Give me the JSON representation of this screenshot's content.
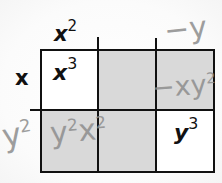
{
  "diagram": {
    "type": "polynomial-multiplication-box",
    "colors": {
      "grid_line": "#111111",
      "shaded_cell": "#d9d9d9",
      "white_cell": "#ffffff",
      "pencil": "#8d8d8d",
      "ink": "#111111"
    },
    "column_headers": [
      {
        "base": "x",
        "exp": "2",
        "source": "printed"
      },
      {
        "base": "",
        "exp": "",
        "source": "blank"
      },
      {
        "base": "−y",
        "exp": "",
        "source": "pencil"
      }
    ],
    "row_headers": [
      {
        "base": "x",
        "exp": "",
        "source": "printed"
      },
      {
        "base": "y",
        "exp": "2",
        "source": "pencil"
      }
    ],
    "cells": [
      [
        {
          "base": "x",
          "exp": "3",
          "source": "printed",
          "fill": "white"
        },
        {
          "base": "",
          "exp": "",
          "source": "blank",
          "fill": "shaded"
        },
        {
          "base": "−xy",
          "exp": "2",
          "source": "pencil",
          "fill": "shaded"
        }
      ],
      [
        {
          "base": "y",
          "exp": "2",
          "base2": "x",
          "exp2": "2",
          "source": "pencil",
          "fill": "shaded"
        },
        {
          "base": "",
          "exp": "",
          "source": "blank",
          "fill": "shaded"
        },
        {
          "base": "y",
          "exp": "3",
          "source": "printed",
          "fill": "white"
        }
      ]
    ]
  }
}
